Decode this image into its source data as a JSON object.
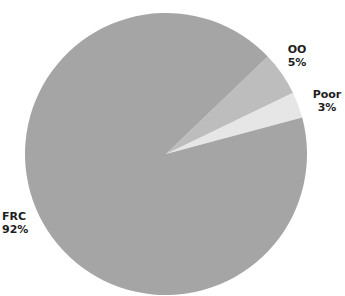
{
  "chart_data": {
    "type": "pie",
    "title": "",
    "categories": [
      "FRC",
      "OO",
      "Poor"
    ],
    "values": [
      92,
      5,
      3
    ],
    "unit": "%",
    "colors": {
      "FRC": "#a5a5a5",
      "OO": "#bdbdbd",
      "Poor": "#e6e6e6"
    },
    "labels": [
      {
        "name": "FRC",
        "value": "92%"
      },
      {
        "name": "OO",
        "value": "5%"
      },
      {
        "name": "Poor",
        "value": "3%"
      }
    ],
    "legend": "none (direct labels)",
    "start_angle_deg": 15,
    "direction": "counterclockwise"
  },
  "slices": [
    {
      "name": "FRC",
      "pct_label": "92%",
      "color": "#a5a5a5"
    },
    {
      "name": "OO",
      "pct_label": "5%",
      "color": "#bdbdbd"
    },
    {
      "name": "Poor",
      "pct_label": "3%",
      "color": "#e6e6e6"
    }
  ],
  "text_color": "#1e1e1e",
  "background": "#ffffff"
}
